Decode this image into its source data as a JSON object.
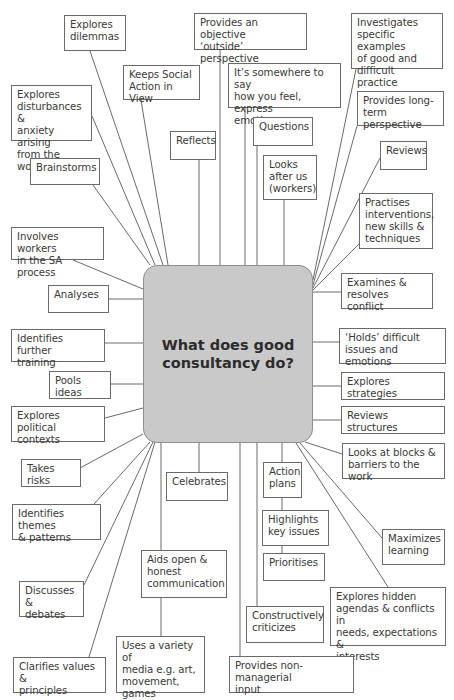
{
  "diagram": {
    "type": "mind-map",
    "center": {
      "label": "What does good\nconsultancy do?",
      "fill": "#c9c9c9"
    },
    "line_color": "#6a6a6a",
    "nodes": [
      {
        "id": "explores-dilemmas",
        "label": "Explores\ndilemmas",
        "x": 64,
        "y": 15,
        "w": 62,
        "h": 36,
        "ax": 90,
        "ay": 51,
        "cx": 163,
        "cy": 265
      },
      {
        "id": "objective-outside-perspective",
        "label": "Provides an objective\n‘outside’ perspective",
        "x": 194,
        "y": 13,
        "w": 113,
        "h": 37,
        "ax": 220,
        "ay": 50,
        "cx": 220,
        "cy": 265
      },
      {
        "id": "investigates-examples",
        "label": "Investigates\nspecific examples\nof good and\ndifficult practice",
        "x": 351,
        "y": 13,
        "w": 92,
        "h": 56,
        "ax": 356,
        "ay": 69,
        "cx": 313,
        "cy": 280
      },
      {
        "id": "keeps-social-action",
        "label": "Keeps Social\nAction in View",
        "x": 123,
        "y": 65,
        "w": 77,
        "h": 35,
        "ax": 141,
        "ay": 100,
        "cx": 168,
        "cy": 265
      },
      {
        "id": "somewhere-to-say",
        "label": "It’s somewhere to say\nhow you feel, express\nemotions",
        "x": 228,
        "y": 63,
        "w": 113,
        "h": 45,
        "ax": 245,
        "ay": 108,
        "cx": 245,
        "cy": 265
      },
      {
        "id": "explores-disturbances",
        "label": "Explores\ndisturbances &\nanxiety arising\nfrom the work",
        "x": 11,
        "y": 85,
        "w": 81,
        "h": 56,
        "ax": 92,
        "ay": 116,
        "cx": 155,
        "cy": 265
      },
      {
        "id": "provides-long-term",
        "label": "Provides long-\nterm perspective",
        "x": 357,
        "y": 91,
        "w": 87,
        "h": 35,
        "ax": 357,
        "ay": 126,
        "cx": 313,
        "cy": 285
      },
      {
        "id": "reflects",
        "label": "Reflects",
        "x": 170,
        "y": 131,
        "w": 46,
        "h": 29,
        "ax": 199,
        "ay": 160,
        "cx": 199,
        "cy": 265
      },
      {
        "id": "questions",
        "label": "Questions",
        "x": 253,
        "y": 117,
        "w": 60,
        "h": 29,
        "ax": 257,
        "ay": 146,
        "cx": 257,
        "cy": 265
      },
      {
        "id": "reviews",
        "label": "Reviews",
        "x": 380,
        "y": 141,
        "w": 47,
        "h": 29,
        "ax": 380,
        "ay": 158,
        "cx": 313,
        "cy": 288
      },
      {
        "id": "brainstorms",
        "label": "Brainstorms",
        "x": 30,
        "y": 158,
        "w": 70,
        "h": 27,
        "ax": 93,
        "ay": 185,
        "cx": 150,
        "cy": 265
      },
      {
        "id": "looks-after-us",
        "label": "Looks\nafter us\n(workers)",
        "x": 263,
        "y": 155,
        "w": 54,
        "h": 45,
        "ax": 284,
        "ay": 200,
        "cx": 284,
        "cy": 265
      },
      {
        "id": "practises-interventions",
        "label": "Practises\ninterventions,\nnew skills &\ntechniques",
        "x": 359,
        "y": 193,
        "w": 74,
        "h": 56,
        "ax": 359,
        "ay": 244,
        "cx": 313,
        "cy": 290
      },
      {
        "id": "involves-workers",
        "label": "Involves workers\nin the SA process",
        "x": 11,
        "y": 227,
        "w": 93,
        "h": 33,
        "ax": 73,
        "ay": 260,
        "cx": 143,
        "cy": 289
      },
      {
        "id": "examines-conflict",
        "label": "Examines &\nresolves conflict",
        "x": 341,
        "y": 273,
        "w": 92,
        "h": 36,
        "ax": 341,
        "ay": 292,
        "cx": 313,
        "cy": 292
      },
      {
        "id": "analyses",
        "label": "Analyses",
        "x": 48,
        "y": 285,
        "w": 61,
        "h": 28,
        "ax": 109,
        "ay": 299,
        "cx": 143,
        "cy": 299
      },
      {
        "id": "identifies-training",
        "label": "Identifies further\ntraining",
        "x": 11,
        "y": 329,
        "w": 94,
        "h": 33,
        "ax": 105,
        "ay": 343,
        "cx": 143,
        "cy": 343
      },
      {
        "id": "holds-difficult",
        "label": "‘Holds’ difficult\nissues and emotions",
        "x": 339,
        "y": 328,
        "w": 107,
        "h": 36,
        "ax": 339,
        "ay": 342,
        "cx": 313,
        "cy": 342
      },
      {
        "id": "pools-ideas",
        "label": "Pools ideas",
        "x": 49,
        "y": 371,
        "w": 62,
        "h": 28,
        "ax": 111,
        "ay": 384,
        "cx": 143,
        "cy": 384
      },
      {
        "id": "explores-strategies",
        "label": "Explores strategies",
        "x": 341,
        "y": 372,
        "w": 104,
        "h": 28,
        "ax": 341,
        "ay": 386,
        "cx": 313,
        "cy": 386
      },
      {
        "id": "explores-political",
        "label": "Explores political\ncontexts",
        "x": 11,
        "y": 406,
        "w": 94,
        "h": 36,
        "ax": 105,
        "ay": 418,
        "cx": 143,
        "cy": 408
      },
      {
        "id": "reviews-structures",
        "label": "Reviews structures",
        "x": 341,
        "y": 406,
        "w": 104,
        "h": 28,
        "ax": 341,
        "ay": 420,
        "cx": 313,
        "cy": 420
      },
      {
        "id": "looks-at-blocks",
        "label": "Looks at blocks &\nbarriers to the work",
        "x": 342,
        "y": 443,
        "w": 103,
        "h": 36,
        "ax": 342,
        "ay": 454,
        "cx": 305,
        "cy": 442
      },
      {
        "id": "takes-risks",
        "label": "Takes risks",
        "x": 21,
        "y": 459,
        "w": 60,
        "h": 28,
        "ax": 80,
        "ay": 468,
        "cx": 143,
        "cy": 434
      },
      {
        "id": "celebrates",
        "label": "Celebrates",
        "x": 166,
        "y": 472,
        "w": 62,
        "h": 29,
        "ax": 199,
        "ay": 472,
        "cx": 199,
        "cy": 443
      },
      {
        "id": "action-plans",
        "label": "Action\nplans",
        "x": 263,
        "y": 462,
        "w": 39,
        "h": 36,
        "ax": 282,
        "ay": 462,
        "cx": 282,
        "cy": 443
      },
      {
        "id": "identifies-themes",
        "label": "Identifies themes\n& patterns",
        "x": 12,
        "y": 504,
        "w": 89,
        "h": 36,
        "ax": 94,
        "ay": 504,
        "cx": 150,
        "cy": 442
      },
      {
        "id": "highlights-key-issues",
        "label": "Highlights\nkey issues",
        "x": 262,
        "y": 510,
        "w": 67,
        "h": 36,
        "ax": 282,
        "ay": 510,
        "cx": 282,
        "cy": 498
      },
      {
        "id": "maximizes-learning",
        "label": "Maximizes\nlearning",
        "x": 382,
        "y": 529,
        "w": 63,
        "h": 36,
        "ax": 382,
        "ay": 538,
        "cx": 300,
        "cy": 443
      },
      {
        "id": "aids-open-communication",
        "label": "Aids open &\nhonest\ncommunication",
        "x": 141,
        "y": 550,
        "w": 86,
        "h": 48,
        "ax": 161,
        "ay": 550,
        "cx": 161,
        "cy": 443
      },
      {
        "id": "prioritises",
        "label": "Prioritises",
        "x": 263,
        "y": 553,
        "w": 62,
        "h": 28,
        "ax": 282,
        "ay": 553,
        "cx": 282,
        "cy": 546
      },
      {
        "id": "discusses-debates",
        "label": "Discusses &\ndebates",
        "x": 19,
        "y": 581,
        "w": 65,
        "h": 36,
        "ax": 84,
        "ay": 585,
        "cx": 153,
        "cy": 442
      },
      {
        "id": "explores-hidden-agendas",
        "label": "Explores hidden\nagendas & conflicts in\nneeds, expectations &\ninterests",
        "x": 330,
        "y": 587,
        "w": 116,
        "h": 59,
        "ax": 388,
        "ay": 587,
        "cx": 296,
        "cy": 443
      },
      {
        "id": "constructively-criticizes",
        "label": "Constructively\ncriticizes",
        "x": 246,
        "y": 606,
        "w": 78,
        "h": 37,
        "ax": 257,
        "ay": 606,
        "cx": 257,
        "cy": 443
      },
      {
        "id": "uses-variety-media",
        "label": "Uses a variety of\nmedia e.g. art,\nmovement,\ngames",
        "x": 116,
        "y": 636,
        "w": 89,
        "h": 57,
        "ax": 161,
        "ay": 636,
        "cx": 161,
        "cy": 598
      },
      {
        "id": "clarifies-values",
        "label": "Clarifies values &\nprinciples",
        "x": 13,
        "y": 657,
        "w": 93,
        "h": 36,
        "ax": 89,
        "ay": 657,
        "cx": 155,
        "cy": 442
      },
      {
        "id": "non-managerial-input",
        "label": "Provides non-managerial\ninput",
        "x": 229,
        "y": 656,
        "w": 125,
        "h": 37,
        "ax": 240,
        "ay": 656,
        "cx": 240,
        "cy": 443
      }
    ]
  }
}
